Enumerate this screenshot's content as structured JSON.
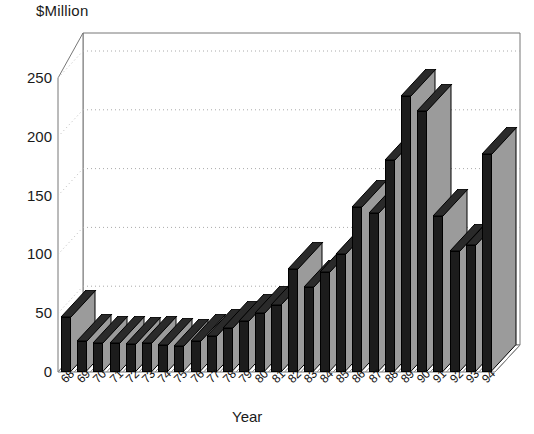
{
  "chart_data": {
    "type": "bar",
    "title": "",
    "ylabel": "$Million",
    "xlabel": "Year",
    "categories": [
      "68",
      "69",
      "70",
      "71",
      "72",
      "73",
      "74",
      "75",
      "76",
      "77",
      "78",
      "79",
      "80",
      "81",
      "82",
      "83",
      "84",
      "85",
      "86",
      "87",
      "88",
      "89",
      "90",
      "91",
      "92",
      "93",
      "94"
    ],
    "values": [
      47,
      26,
      25,
      25,
      24,
      25,
      23,
      22,
      26,
      31,
      37,
      43,
      50,
      57,
      88,
      72,
      85,
      100,
      140,
      135,
      180,
      235,
      222,
      133,
      103,
      108,
      185
    ],
    "ylim": [
      0,
      270
    ],
    "yticks": [
      0,
      50,
      100,
      150,
      200,
      250
    ],
    "ytick_labels": [
      "0",
      "50",
      "100",
      "150",
      "200",
      "250"
    ],
    "grid": true,
    "grid_style": "dotted-horizontal-back-wall",
    "legend": null,
    "three_d": true,
    "series": [
      {
        "name": "",
        "values": [
          47,
          26,
          25,
          25,
          24,
          25,
          23,
          22,
          26,
          31,
          37,
          43,
          50,
          57,
          88,
          72,
          85,
          100,
          140,
          135,
          180,
          235,
          222,
          133,
          103,
          108,
          185
        ]
      }
    ],
    "colors": {
      "bar_front": "#1c1c1c",
      "bar_side": "#9b9b9b",
      "bar_top": "#2a2a2a",
      "frame": "#555555",
      "grid": "#aaaaaa",
      "text": "#111111",
      "background": "#ffffff"
    }
  },
  "axes": {
    "y_title": "$Million",
    "x_title": "Year"
  }
}
